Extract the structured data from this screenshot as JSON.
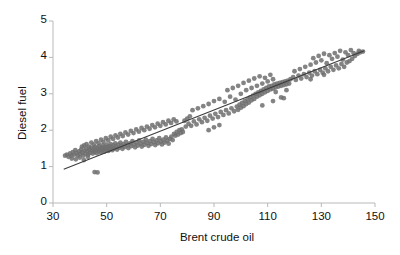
{
  "chart_data": {
    "type": "scatter",
    "title": "",
    "xlabel": "Brent crude oil",
    "ylabel": "Diesel fuel",
    "xlim": [
      30,
      150
    ],
    "ylim": [
      0,
      5
    ],
    "xticks": [
      30,
      50,
      70,
      90,
      110,
      130,
      150
    ],
    "yticks": [
      0,
      1,
      2,
      3,
      4,
      5
    ],
    "grid": false,
    "legend": null,
    "marker": {
      "shape": "circle",
      "color": "#6e6e6e",
      "size": 2.4
    },
    "trendline": {
      "type": "linear",
      "color": "#3c3c3c",
      "x_start": 34.0,
      "x_end": 146.0,
      "y_start": 0.93,
      "y_end": 4.18,
      "slope": 0.029,
      "intercept": -0.06
    },
    "points": [
      [
        34.5,
        1.3
      ],
      [
        35.2,
        1.33
      ],
      [
        35.8,
        1.27
      ],
      [
        36.4,
        1.36
      ],
      [
        36.9,
        1.3
      ],
      [
        37.4,
        1.4
      ],
      [
        37.9,
        1.33
      ],
      [
        38.3,
        1.45
      ],
      [
        38.8,
        1.37
      ],
      [
        39.2,
        1.3
      ],
      [
        39.7,
        1.42
      ],
      [
        40.1,
        1.35
      ],
      [
        40.5,
        1.47
      ],
      [
        40.9,
        1.39
      ],
      [
        41.3,
        1.3
      ],
      [
        41.7,
        1.44
      ],
      [
        42.0,
        1.36
      ],
      [
        42.4,
        1.5
      ],
      [
        42.8,
        1.42
      ],
      [
        43.1,
        1.33
      ],
      [
        43.5,
        1.46
      ],
      [
        43.8,
        1.38
      ],
      [
        44.1,
        1.52
      ],
      [
        44.5,
        1.44
      ],
      [
        44.8,
        1.36
      ],
      [
        45.1,
        1.48
      ],
      [
        45.4,
        1.4
      ],
      [
        45.7,
        1.54
      ],
      [
        46.0,
        1.45
      ],
      [
        46.3,
        1.37
      ],
      [
        46.6,
        1.5
      ],
      [
        46.9,
        1.42
      ],
      [
        47.2,
        1.56
      ],
      [
        47.5,
        1.47
      ],
      [
        47.8,
        1.39
      ],
      [
        48.1,
        1.52
      ],
      [
        48.3,
        1.44
      ],
      [
        48.6,
        1.58
      ],
      [
        48.9,
        1.49
      ],
      [
        49.1,
        1.41
      ],
      [
        49.4,
        1.54
      ],
      [
        49.7,
        1.46
      ],
      [
        50.0,
        1.6
      ],
      [
        50.3,
        1.51
      ],
      [
        50.6,
        1.43
      ],
      [
        50.9,
        1.56
      ],
      [
        51.2,
        1.48
      ],
      [
        51.5,
        1.62
      ],
      [
        51.8,
        1.53
      ],
      [
        52.1,
        1.45
      ],
      [
        52.5,
        1.58
      ],
      [
        52.8,
        1.5
      ],
      [
        53.2,
        1.64
      ],
      [
        53.5,
        1.55
      ],
      [
        53.9,
        1.47
      ],
      [
        54.3,
        1.6
      ],
      [
        54.7,
        1.52
      ],
      [
        55.1,
        1.66
      ],
      [
        55.5,
        1.57
      ],
      [
        55.9,
        1.49
      ],
      [
        56.3,
        1.62
      ],
      [
        56.8,
        1.54
      ],
      [
        57.2,
        1.68
      ],
      [
        57.7,
        1.59
      ],
      [
        58.1,
        1.51
      ],
      [
        58.6,
        1.64
      ],
      [
        59.1,
        1.56
      ],
      [
        59.6,
        1.7
      ],
      [
        60.1,
        1.61
      ],
      [
        60.6,
        1.53
      ],
      [
        61.1,
        1.66
      ],
      [
        61.6,
        1.58
      ],
      [
        62.1,
        1.72
      ],
      [
        62.6,
        1.63
      ],
      [
        63.1,
        1.55
      ],
      [
        63.6,
        1.68
      ],
      [
        64.1,
        1.6
      ],
      [
        64.6,
        1.74
      ],
      [
        65.1,
        1.65
      ],
      [
        65.6,
        1.57
      ],
      [
        66.1,
        1.7
      ],
      [
        66.6,
        1.62
      ],
      [
        67.1,
        1.76
      ],
      [
        67.6,
        1.67
      ],
      [
        68.1,
        1.59
      ],
      [
        68.6,
        1.72
      ],
      [
        69.1,
        1.64
      ],
      [
        69.6,
        1.78
      ],
      [
        70.1,
        1.69
      ],
      [
        70.6,
        1.61
      ],
      [
        71.1,
        1.74
      ],
      [
        71.6,
        1.66
      ],
      [
        72.1,
        1.8
      ],
      [
        72.6,
        1.71
      ],
      [
        73.1,
        1.63
      ],
      [
        73.6,
        1.76
      ],
      [
        74.1,
        1.82
      ],
      [
        74.6,
        1.73
      ],
      [
        75.1,
        1.9
      ],
      [
        75.6,
        1.85
      ],
      [
        76.1,
        1.95
      ],
      [
        76.6,
        1.88
      ],
      [
        77.1,
        2.0
      ],
      [
        77.6,
        1.92
      ],
      [
        78.0,
        2.02
      ],
      [
        78.4,
        1.95
      ],
      [
        40.8,
        1.55
      ],
      [
        41.6,
        1.58
      ],
      [
        42.5,
        1.62
      ],
      [
        43.4,
        1.55
      ],
      [
        44.3,
        1.66
      ],
      [
        45.2,
        1.6
      ],
      [
        46.1,
        1.7
      ],
      [
        47.0,
        1.64
      ],
      [
        47.9,
        1.74
      ],
      [
        48.8,
        1.68
      ],
      [
        49.7,
        1.78
      ],
      [
        50.6,
        1.72
      ],
      [
        51.5,
        1.82
      ],
      [
        52.4,
        1.76
      ],
      [
        53.3,
        1.86
      ],
      [
        54.2,
        1.8
      ],
      [
        55.1,
        1.9
      ],
      [
        56.0,
        1.84
      ],
      [
        57.0,
        1.94
      ],
      [
        58.0,
        1.88
      ],
      [
        59.0,
        1.98
      ],
      [
        60.0,
        1.92
      ],
      [
        61.0,
        2.02
      ],
      [
        62.0,
        1.96
      ],
      [
        63.0,
        2.06
      ],
      [
        64.0,
        2.0
      ],
      [
        65.0,
        2.1
      ],
      [
        66.0,
        2.04
      ],
      [
        67.0,
        2.14
      ],
      [
        68.0,
        2.08
      ],
      [
        69.0,
        2.18
      ],
      [
        70.0,
        2.12
      ],
      [
        71.0,
        2.22
      ],
      [
        72.0,
        2.16
      ],
      [
        73.0,
        2.26
      ],
      [
        74.0,
        2.2
      ],
      [
        75.0,
        2.3
      ],
      [
        76.0,
        2.24
      ],
      [
        45.5,
        0.85
      ],
      [
        46.6,
        0.84
      ],
      [
        37.0,
        1.22
      ],
      [
        38.5,
        1.2
      ],
      [
        40.0,
        1.25
      ],
      [
        41.5,
        1.18
      ],
      [
        43.0,
        1.27
      ],
      [
        79.5,
        2.1
      ],
      [
        80.5,
        2.18
      ],
      [
        81.5,
        2.12
      ],
      [
        82.5,
        2.24
      ],
      [
        83.5,
        2.16
      ],
      [
        84.5,
        2.3
      ],
      [
        85.5,
        2.22
      ],
      [
        86.5,
        2.34
      ],
      [
        87.5,
        2.26
      ],
      [
        88.5,
        2.4
      ],
      [
        89.5,
        2.32
      ],
      [
        90.5,
        2.45
      ],
      [
        91.5,
        2.36
      ],
      [
        92.5,
        2.5
      ],
      [
        93.5,
        2.42
      ],
      [
        94.5,
        2.55
      ],
      [
        95.5,
        2.46
      ],
      [
        96.5,
        2.6
      ],
      [
        97.5,
        2.52
      ],
      [
        98.5,
        2.65
      ],
      [
        99.0,
        2.56
      ],
      [
        99.5,
        2.7
      ],
      [
        100.0,
        2.62
      ],
      [
        100.5,
        2.75
      ],
      [
        101.0,
        2.66
      ],
      [
        101.5,
        2.8
      ],
      [
        102.0,
        2.72
      ],
      [
        102.5,
        2.85
      ],
      [
        103.0,
        2.76
      ],
      [
        103.5,
        2.9
      ],
      [
        104.0,
        2.82
      ],
      [
        104.5,
        2.95
      ],
      [
        105.0,
        2.86
      ],
      [
        105.5,
        3.0
      ],
      [
        106.0,
        2.92
      ],
      [
        106.5,
        3.04
      ],
      [
        107.0,
        2.96
      ],
      [
        107.5,
        3.08
      ],
      [
        108.0,
        3.0
      ],
      [
        108.5,
        3.12
      ],
      [
        109.0,
        3.04
      ],
      [
        109.5,
        3.16
      ],
      [
        110.0,
        3.08
      ],
      [
        110.5,
        3.2
      ],
      [
        111.0,
        3.12
      ],
      [
        111.5,
        3.22
      ],
      [
        112.0,
        3.14
      ],
      [
        112.5,
        3.26
      ],
      [
        113.0,
        3.18
      ],
      [
        113.5,
        3.28
      ],
      [
        114.0,
        3.2
      ],
      [
        114.5,
        3.3
      ],
      [
        115.0,
        3.22
      ],
      [
        115.5,
        3.32
      ],
      [
        116.0,
        3.24
      ],
      [
        116.5,
        3.34
      ],
      [
        117.0,
        3.26
      ],
      [
        117.5,
        3.36
      ],
      [
        118.0,
        3.28
      ],
      [
        82.0,
        2.55
      ],
      [
        84.0,
        2.6
      ],
      [
        86.0,
        2.66
      ],
      [
        88.0,
        2.72
      ],
      [
        90.0,
        2.8
      ],
      [
        92.0,
        2.86
      ],
      [
        94.0,
        2.78
      ],
      [
        96.0,
        2.92
      ],
      [
        98.0,
        2.84
      ],
      [
        100.0,
        3.0
      ],
      [
        102.0,
        3.1
      ],
      [
        104.0,
        3.16
      ],
      [
        106.0,
        3.22
      ],
      [
        108.0,
        3.28
      ],
      [
        110.0,
        3.34
      ],
      [
        112.0,
        3.4
      ],
      [
        95.0,
        3.1
      ],
      [
        97.0,
        3.16
      ],
      [
        99.0,
        3.22
      ],
      [
        101.0,
        3.3
      ],
      [
        103.0,
        3.36
      ],
      [
        105.0,
        3.42
      ],
      [
        107.0,
        3.48
      ],
      [
        109.0,
        3.44
      ],
      [
        111.0,
        3.52
      ],
      [
        113.0,
        3.05
      ],
      [
        115.0,
        2.9
      ],
      [
        117.0,
        3.1
      ],
      [
        118.5,
        3.4
      ],
      [
        119.5,
        3.46
      ],
      [
        120.5,
        3.38
      ],
      [
        121.5,
        3.5
      ],
      [
        122.5,
        3.42
      ],
      [
        123.5,
        3.54
      ],
      [
        124.5,
        3.46
      ],
      [
        125.5,
        3.58
      ],
      [
        126.5,
        3.5
      ],
      [
        127.5,
        3.62
      ],
      [
        128.5,
        3.54
      ],
      [
        129.5,
        3.66
      ],
      [
        130.5,
        3.58
      ],
      [
        131.5,
        3.7
      ],
      [
        132.5,
        3.62
      ],
      [
        133.5,
        3.74
      ],
      [
        134.5,
        3.66
      ],
      [
        135.5,
        3.78
      ],
      [
        136.5,
        3.7
      ],
      [
        137.5,
        3.82
      ],
      [
        138.5,
        3.74
      ],
      [
        139.5,
        3.86
      ],
      [
        140.5,
        3.9
      ],
      [
        141.5,
        3.96
      ],
      [
        142.5,
        4.04
      ],
      [
        143.5,
        4.1
      ],
      [
        144.5,
        4.14
      ],
      [
        145.5,
        4.16
      ],
      [
        120.0,
        3.62
      ],
      [
        122.0,
        3.68
      ],
      [
        124.0,
        3.74
      ],
      [
        126.0,
        3.8
      ],
      [
        128.0,
        3.86
      ],
      [
        130.0,
        3.92
      ],
      [
        132.0,
        3.84
      ],
      [
        134.0,
        3.96
      ],
      [
        136.0,
        4.02
      ],
      [
        138.0,
        3.94
      ],
      [
        140.0,
        4.06
      ],
      [
        142.0,
        4.12
      ],
      [
        144.0,
        4.18
      ],
      [
        127.0,
        3.98
      ],
      [
        129.0,
        4.04
      ],
      [
        131.0,
        4.1
      ],
      [
        133.0,
        4.06
      ],
      [
        135.0,
        4.12
      ],
      [
        137.0,
        4.18
      ],
      [
        139.0,
        4.14
      ],
      [
        141.0,
        4.2
      ],
      [
        126.0,
        3.4
      ],
      [
        131.0,
        3.52
      ],
      [
        108.0,
        2.68
      ],
      [
        112.0,
        2.8
      ],
      [
        116.0,
        2.88
      ],
      [
        88.0,
        2.0
      ],
      [
        90.0,
        2.08
      ],
      [
        92.0,
        2.14
      ],
      [
        79.0,
        2.26
      ],
      [
        80.0,
        2.32
      ],
      [
        81.0,
        2.38
      ]
    ]
  }
}
